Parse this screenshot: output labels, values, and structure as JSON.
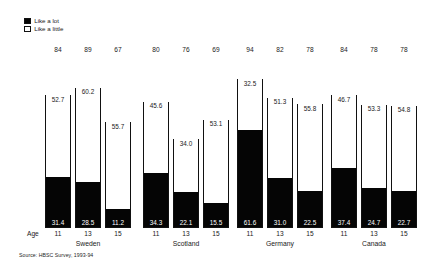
{
  "legend": {
    "items": [
      {
        "label": "Like a lot",
        "swatch": "filled",
        "color": "#050505"
      },
      {
        "label": "Like a little",
        "swatch": "hollow",
        "color": "#ffffff"
      }
    ]
  },
  "axis": {
    "row_label": "Age",
    "age_ticks": [
      "11",
      "13",
      "15"
    ]
  },
  "source": "Source: HBSC Survey, 1993-94",
  "chart_data": {
    "type": "bar",
    "subtype": "stacked-bar",
    "title": "",
    "subtitle": "",
    "xlabel": "Age",
    "ylabel": "",
    "ylim": [
      0,
      100
    ],
    "grid": false,
    "legend_position": "top-left",
    "stack_order": [
      "Like a lot",
      "Like a little"
    ],
    "categories": [
      "Sweden 11",
      "Sweden 13",
      "Sweden 15",
      "Scotland 11",
      "Scotland 13",
      "Scotland 15",
      "Germany 11",
      "Germany 13",
      "Germany 15",
      "Canada 11",
      "Canada 13",
      "Canada 15"
    ],
    "series": [
      {
        "name": "Like a lot",
        "color": "#050505",
        "values": [
          31.4,
          28.5,
          11.2,
          34.3,
          22.1,
          15.5,
          61.6,
          31.0,
          22.5,
          37.4,
          24.7,
          22.7
        ]
      },
      {
        "name": "Like a little",
        "color": "#ffffff",
        "values": [
          52.7,
          60.2,
          55.7,
          45.6,
          34.0,
          53.1,
          32.5,
          51.3,
          55.8,
          46.7,
          53.3,
          54.8
        ]
      }
    ],
    "totals": [
      84,
      89,
      67,
      80,
      76,
      69,
      94,
      82,
      78,
      84,
      78,
      78
    ],
    "groups": [
      {
        "country": "Sweden",
        "bars": [
          {
            "age": "11",
            "total": "84",
            "like_a_little": "52.7",
            "like_a_lot": "31.4"
          },
          {
            "age": "13",
            "total": "89",
            "like_a_little": "60.2",
            "like_a_lot": "28.5"
          },
          {
            "age": "15",
            "total": "67",
            "like_a_little": "55.7",
            "like_a_lot": "11.2"
          }
        ]
      },
      {
        "country": "Scotland",
        "bars": [
          {
            "age": "11",
            "total": "80",
            "like_a_little": "45.6",
            "like_a_lot": "34.3"
          },
          {
            "age": "13",
            "total": "76",
            "like_a_little": "34.0",
            "like_a_lot": "22.1"
          },
          {
            "age": "15",
            "total": "69",
            "like_a_little": "53.1",
            "like_a_lot": "15.5"
          }
        ]
      },
      {
        "country": "Germany",
        "bars": [
          {
            "age": "11",
            "total": "94",
            "like_a_little": "32.5",
            "like_a_lot": "61.6"
          },
          {
            "age": "13",
            "total": "82",
            "like_a_little": "51.3",
            "like_a_lot": "31.0"
          },
          {
            "age": "15",
            "total": "78",
            "like_a_little": "55.8",
            "like_a_lot": "22.5"
          }
        ]
      },
      {
        "country": "Canada",
        "bars": [
          {
            "age": "11",
            "total": "84",
            "like_a_little": "46.7",
            "like_a_lot": "37.4"
          },
          {
            "age": "13",
            "total": "78",
            "like_a_little": "53.3",
            "like_a_lot": "24.7"
          },
          {
            "age": "15",
            "total": "78",
            "like_a_little": "54.8",
            "like_a_lot": "22.7"
          }
        ]
      }
    ]
  }
}
